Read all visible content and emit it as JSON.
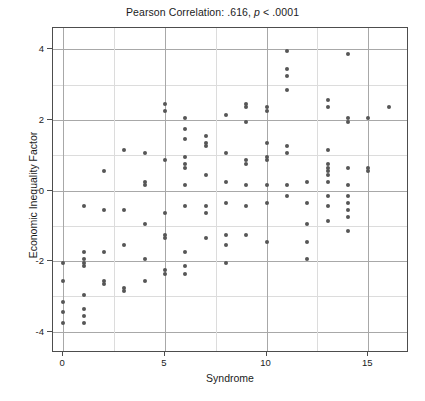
{
  "chart_data": {
    "type": "scatter",
    "title": "Pearson Correlation: .616, p < .0001",
    "title_prefix": "Pearson Correlation: .616, ",
    "title_italic": "p",
    "title_suffix": " < .0001",
    "xlabel": "Syndrome",
    "ylabel": "Economic Inequality Factor",
    "xlim": [
      -0.5,
      17.0
    ],
    "ylim": [
      -4.6,
      4.6
    ],
    "xticks": [
      0,
      5,
      10,
      15
    ],
    "xtick_labels": [
      "0",
      "5",
      "10",
      "15"
    ],
    "yticks": [
      -4,
      -2,
      0,
      2,
      4
    ],
    "ytick_labels": [
      "-4",
      "-2",
      "0",
      "2",
      "4"
    ],
    "x_minor_gridlines": [
      2.5,
      7.5,
      12.5
    ],
    "y_minor_gridlines": [
      3,
      1,
      -1,
      -3
    ],
    "grid": true,
    "legend": false,
    "point_color": "#565656",
    "point_size": 4,
    "correlation_r": 0.616,
    "p_value_text": "< .0001",
    "points": [
      [
        0,
        -2.05
      ],
      [
        0,
        -2.55
      ],
      [
        0,
        -3.15
      ],
      [
        0,
        -3.45
      ],
      [
        0,
        -3.75
      ],
      [
        1,
        -0.45
      ],
      [
        1,
        -1.75
      ],
      [
        1,
        -1.95
      ],
      [
        1,
        -2.05
      ],
      [
        1,
        -2.15
      ],
      [
        1,
        -2.95
      ],
      [
        1,
        -3.35
      ],
      [
        1,
        -3.55
      ],
      [
        1,
        -3.75
      ],
      [
        2,
        0.55
      ],
      [
        2,
        -0.55
      ],
      [
        2,
        -1.75
      ],
      [
        2,
        -2.55
      ],
      [
        2,
        -2.65
      ],
      [
        3,
        1.15
      ],
      [
        3,
        -0.55
      ],
      [
        3,
        -1.55
      ],
      [
        3,
        -2.75
      ],
      [
        3,
        -2.85
      ],
      [
        4,
        1.05
      ],
      [
        4,
        0.25
      ],
      [
        4,
        0.15
      ],
      [
        4,
        -0.95
      ],
      [
        4,
        -1.95
      ],
      [
        4,
        -2.55
      ],
      [
        5,
        2.45
      ],
      [
        5,
        2.25
      ],
      [
        5,
        0.85
      ],
      [
        5,
        -0.65
      ],
      [
        5,
        -1.25
      ],
      [
        5,
        -1.35
      ],
      [
        5,
        -2.25
      ],
      [
        5,
        -2.35
      ],
      [
        6,
        2.05
      ],
      [
        6,
        1.75
      ],
      [
        6,
        1.45
      ],
      [
        6,
        0.95
      ],
      [
        6,
        0.75
      ],
      [
        6,
        0.65
      ],
      [
        6,
        0.15
      ],
      [
        6,
        -0.45
      ],
      [
        6,
        -1.75
      ],
      [
        6,
        -2.15
      ],
      [
        6,
        -2.35
      ],
      [
        7,
        1.55
      ],
      [
        7,
        1.35
      ],
      [
        7,
        1.25
      ],
      [
        7,
        0.45
      ],
      [
        7,
        -0.45
      ],
      [
        7,
        -0.65
      ],
      [
        7,
        -1.35
      ],
      [
        8,
        2.15
      ],
      [
        8,
        1.05
      ],
      [
        8,
        0.25
      ],
      [
        8,
        -0.35
      ],
      [
        8,
        -1.25
      ],
      [
        8,
        -1.55
      ],
      [
        8,
        -2.05
      ],
      [
        9,
        2.45
      ],
      [
        9,
        2.35
      ],
      [
        9,
        1.95
      ],
      [
        9,
        0.85
      ],
      [
        9,
        0.75
      ],
      [
        9,
        0.15
      ],
      [
        9,
        -0.45
      ],
      [
        9,
        -1.25
      ],
      [
        10,
        2.35
      ],
      [
        10,
        2.25
      ],
      [
        10,
        1.35
      ],
      [
        10,
        0.95
      ],
      [
        10,
        0.85
      ],
      [
        10,
        0.15
      ],
      [
        10,
        -0.35
      ],
      [
        10,
        -1.45
      ],
      [
        11,
        3.95
      ],
      [
        11,
        3.45
      ],
      [
        11,
        3.25
      ],
      [
        11,
        2.85
      ],
      [
        11,
        1.25
      ],
      [
        11,
        1.05
      ],
      [
        11,
        0.15
      ],
      [
        11,
        -0.15
      ],
      [
        12,
        0.25
      ],
      [
        12,
        -0.35
      ],
      [
        12,
        -0.95
      ],
      [
        12,
        -1.45
      ],
      [
        12,
        -1.95
      ],
      [
        13,
        2.55
      ],
      [
        13,
        2.35
      ],
      [
        13,
        1.15
      ],
      [
        13,
        0.75
      ],
      [
        13,
        0.65
      ],
      [
        13,
        0.55
      ],
      [
        13,
        0.45
      ],
      [
        13,
        0.25
      ],
      [
        13,
        -0.15
      ],
      [
        13,
        -0.45
      ],
      [
        13,
        -0.85
      ],
      [
        14,
        3.85
      ],
      [
        14,
        2.05
      ],
      [
        14,
        1.95
      ],
      [
        14,
        0.65
      ],
      [
        14,
        0.15
      ],
      [
        14,
        -0.15
      ],
      [
        14,
        -0.35
      ],
      [
        14,
        -0.55
      ],
      [
        14,
        -0.75
      ],
      [
        14,
        -1.15
      ],
      [
        15,
        2.05
      ],
      [
        15,
        0.65
      ],
      [
        15,
        0.55
      ],
      [
        16,
        2.35
      ]
    ]
  }
}
